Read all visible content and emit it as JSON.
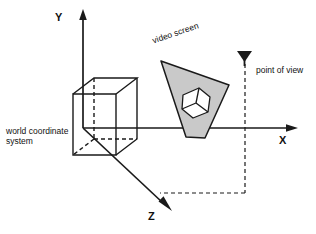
{
  "diagram": {
    "background_color": "#ffffff",
    "line_color": "#1a1a1a",
    "screen_fill": "#c9c9c9",
    "inner_cube_fill": "#ffffff"
  },
  "axes": {
    "y": {
      "label": "Y",
      "direction": "up"
    },
    "x": {
      "label": "X",
      "direction": "right"
    },
    "z": {
      "label": "Z",
      "direction": "down-right"
    },
    "origin": {
      "x": 83,
      "y": 128
    }
  },
  "labels": {
    "world_coordinate_system": "world coordinate\nsystem",
    "world_coordinate_line1": "world coordinate",
    "world_coordinate_line2": "system",
    "video_screen": "video screen",
    "point_of_view": "point of view"
  },
  "objects": {
    "wire_cube": {
      "name": "wireframe cube",
      "style": "solid visible edges, dashed hidden edges"
    },
    "video_screen": {
      "name": "video screen",
      "shape": "tilted quadrilateral",
      "fill": "#c9c9c9",
      "contains": "projected cube image"
    },
    "projected_cube": {
      "name": "projected cube on screen",
      "fill": "#ffffff"
    },
    "viewpoint_marker": {
      "name": "point of view eye marker",
      "glyph": "viewpoint-arrow"
    },
    "sight_lines": {
      "name": "dashed projection lines",
      "style": "dashed"
    }
  }
}
